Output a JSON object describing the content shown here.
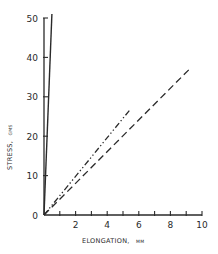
{
  "chart_data": {
    "type": "line",
    "title": "",
    "xlabel": "ELONGATION, mm",
    "ylabel": "STRESS, gms",
    "xlim": [
      0,
      10
    ],
    "ylim": [
      0,
      50
    ],
    "x_ticks": [
      0,
      2,
      4,
      6,
      8,
      10
    ],
    "x_tick_labels": [
      "",
      "2",
      "4",
      "6",
      "8",
      "10"
    ],
    "x_minor_ticks": [
      1,
      3,
      5,
      7,
      9
    ],
    "y_ticks": [
      0,
      10,
      20,
      30,
      40,
      50
    ],
    "y_tick_labels": [
      "0",
      "10",
      "20",
      "30",
      "40",
      "50"
    ],
    "grid": false,
    "legend": null,
    "series": [
      {
        "name": "solid",
        "style": "solid",
        "x": [
          0,
          0.5
        ],
        "y": [
          0,
          51
        ]
      },
      {
        "name": "dash-dot-dot",
        "style": "dash-dot-dot",
        "x": [
          0,
          5.4
        ],
        "y": [
          0,
          26.5
        ]
      },
      {
        "name": "dashed",
        "style": "dashed",
        "x": [
          0,
          9.2
        ],
        "y": [
          0,
          37
        ]
      }
    ]
  },
  "axes": {
    "x_title": "ELONGATION,",
    "x_unit": "MM",
    "y_title": "STRESS,",
    "y_unit": "GMS",
    "origin_label": "0"
  },
  "colors": {
    "ink": "#2a2a2a",
    "background": "#ffffff"
  }
}
